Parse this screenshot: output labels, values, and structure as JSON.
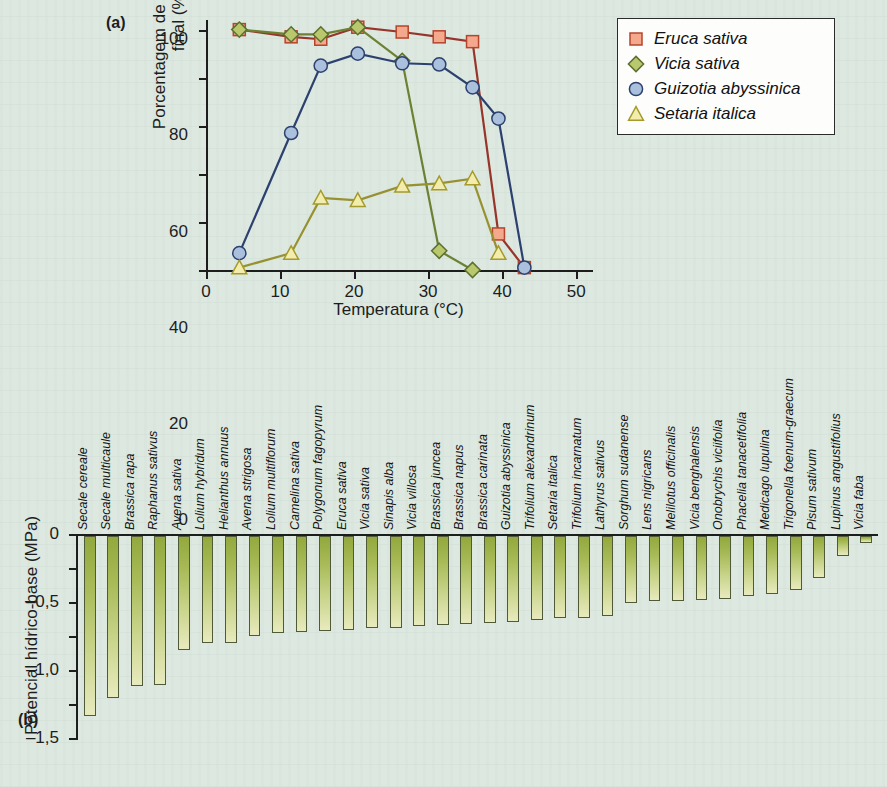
{
  "panels": {
    "a": {
      "letter": "(a)"
    },
    "b": {
      "letter": "(b)"
    }
  },
  "chart_data": [
    {
      "id": "panel-a",
      "type": "line",
      "title": "",
      "xlabel": "Temperatura (°C)",
      "ylabel": "Porcentagem de germinação final (%)",
      "xlim": [
        0,
        52
      ],
      "ylim": [
        0,
        104
      ],
      "xticks": [
        0,
        10,
        20,
        30,
        40,
        50
      ],
      "xtick_labels": [
        "0",
        "10",
        "20",
        "30",
        "40",
        "50"
      ],
      "yticks": [
        0,
        20,
        40,
        60,
        80,
        100
      ],
      "ytick_labels": [
        "0",
        "20",
        "40",
        "60",
        "80",
        "100"
      ],
      "grid": false,
      "legend_position": "upper right",
      "series": [
        {
          "name": "Eruca sativa",
          "marker": "square",
          "fill": "#f4a98c",
          "edge": "#b5452c",
          "line": "#97352a",
          "x": [
            4.5,
            11.5,
            15.5,
            20.5,
            26.5,
            31.5,
            36.0,
            39.5,
            43.0
          ],
          "y": [
            100,
            97,
            96,
            101,
            99,
            97,
            95,
            15,
            1
          ]
        },
        {
          "name": "Vicia sativa",
          "marker": "diamond",
          "fill": "#b9c76d",
          "edge": "#5c7030",
          "line": "#6d8133",
          "x": [
            4.5,
            11.5,
            15.5,
            20.5,
            26.5,
            31.5,
            36.0
          ],
          "y": [
            100,
            98,
            98,
            101,
            87,
            8,
            0
          ]
        },
        {
          "name": "Guizotia abyssinica",
          "marker": "circle",
          "fill": "#aac0dd",
          "edge": "#2c416f",
          "line": "#2c416f",
          "x": [
            4.5,
            11.5,
            15.5,
            20.5,
            26.5,
            31.5,
            36.0,
            39.5,
            43.0
          ],
          "y": [
            7,
            57,
            85,
            90,
            86,
            85.5,
            76,
            63,
            1
          ]
        },
        {
          "name": "Setaria italica",
          "marker": "triangle",
          "fill": "#f3edad",
          "edge": "#a59a2c",
          "line": "#97912f",
          "x": [
            4.5,
            11.5,
            15.5,
            20.5,
            26.5,
            31.5,
            36.0,
            39.5
          ],
          "y": [
            1,
            7,
            30,
            29,
            35,
            36,
            38,
            7
          ]
        }
      ]
    },
    {
      "id": "panel-b",
      "type": "bar",
      "title": "",
      "xlabel": "",
      "ylabel": "Potencial hídrico-base (MPa)",
      "ylim": [
        -3.0,
        0
      ],
      "yticks": [
        0,
        -0.5,
        -1.0,
        -1.5,
        -2.0,
        -2.5,
        -3.0
      ],
      "ytick_labels": [
        "0",
        "–0,5",
        "–1,0",
        "–1,5",
        "–2,0",
        "–2,5",
        "–3,0"
      ],
      "grid": false,
      "categories": [
        "Secale cereale",
        "Secale multicaule",
        "Brassica rapa",
        "Raphanus sativus",
        "Avena sativa",
        "Lolium hybridum",
        "Helianthus annuus",
        "Avena strigosa",
        "Lolium multiflorum",
        "Camelina sativa",
        "Polygonum fagopyrum",
        "Eruca sativa",
        "Vicia sativa",
        "Sinapis alba",
        "Vicia villosa",
        "Brassica juncea",
        "Brassica napus",
        "Brassica carinata",
        "Guizotia abyssinica",
        "Trifolium alexandrinum",
        "Setaria italica",
        "Trifolium incarnatum",
        "Lathyrus sativus",
        "Sorghum sudanense",
        "Lens nigricans",
        "Melilotus officinalis",
        "Vicia benghalensis",
        "Onobrychis viciifolia",
        "Phacelia tanacetifolia",
        "Medicago lupulina",
        "Trigonella foenum-graecum",
        "Pisum sativum",
        "Lupinus angustifolius",
        "Vicia faba"
      ],
      "values": [
        -2.65,
        -2.38,
        -2.21,
        -2.19,
        -1.68,
        -1.58,
        -1.58,
        -1.47,
        -1.43,
        -1.41,
        -1.4,
        -1.38,
        -1.36,
        -1.35,
        -1.33,
        -1.31,
        -1.3,
        -1.28,
        -1.26,
        -1.24,
        -1.21,
        -1.2,
        -1.17,
        -0.98,
        -0.96,
        -0.95,
        -0.94,
        -0.92,
        -0.88,
        -0.86,
        -0.8,
        -0.62,
        -0.3,
        -0.1
      ]
    }
  ]
}
